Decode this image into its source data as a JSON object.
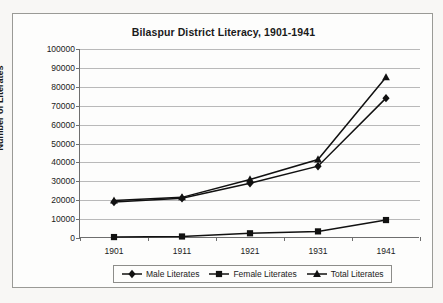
{
  "chart_data": {
    "type": "line",
    "title": "Bilaspur District Literacy, 1901-1941",
    "xlabel": "",
    "ylabel": "Number of Literates",
    "categories": [
      "1901",
      "1911",
      "1921",
      "1931",
      "1941"
    ],
    "x": [
      1901,
      1911,
      1921,
      1931,
      1941
    ],
    "series": [
      {
        "name": "Male Literates",
        "marker": "diamond",
        "values": [
          19000,
          21000,
          29000,
          38000,
          74000
        ]
      },
      {
        "name": "Female Literates",
        "marker": "square",
        "values": [
          500,
          800,
          2500,
          3500,
          9500
        ]
      },
      {
        "name": "Total Literates",
        "marker": "triangle",
        "values": [
          19800,
          21500,
          31000,
          41500,
          85000
        ]
      }
    ],
    "ylim": [
      0,
      100000
    ],
    "ytick_values": [
      0,
      10000,
      20000,
      30000,
      40000,
      50000,
      60000,
      70000,
      80000,
      90000,
      100000
    ],
    "ytick_labels": [
      "0",
      "10000",
      "20000",
      "30000",
      "40000",
      "50000",
      "60000",
      "70000",
      "80000",
      "90000",
      "100000"
    ],
    "grid": "horizontal",
    "legend_position": "bottom",
    "line_color": "#111111",
    "grid_color": "#b9b9b9",
    "axis_color": "#6e6e6e"
  },
  "legend": {
    "items": [
      {
        "label": "Male Literates"
      },
      {
        "label": "Female Literates"
      },
      {
        "label": "Total Literates"
      }
    ]
  }
}
